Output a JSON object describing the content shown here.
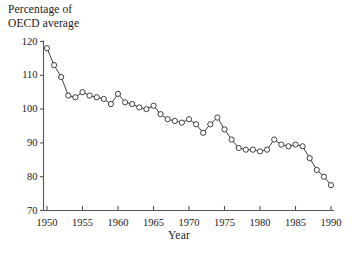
{
  "chart_data": {
    "type": "line",
    "title": "",
    "ylabel": "Percentage of\nOECD average",
    "xlabel": "Year",
    "grid": false,
    "legend": null,
    "marker": "open-circle",
    "xlim": [
      1949,
      1991
    ],
    "ylim": [
      70,
      121
    ],
    "xticks": [
      1950,
      1955,
      1960,
      1965,
      1970,
      1975,
      1980,
      1985,
      1990
    ],
    "xtick_labels": [
      "1950",
      "1955",
      "1960",
      "1965",
      "1970",
      "1975",
      "1980",
      "1985",
      "1990"
    ],
    "yticks": [
      70,
      80,
      90,
      100,
      110,
      120
    ],
    "ytick_labels": [
      "70",
      "80",
      "90",
      "100",
      "110",
      "120"
    ],
    "x": [
      1950,
      1951,
      1952,
      1953,
      1954,
      1955,
      1956,
      1957,
      1958,
      1959,
      1960,
      1961,
      1962,
      1963,
      1964,
      1965,
      1966,
      1967,
      1968,
      1969,
      1970,
      1971,
      1972,
      1973,
      1974,
      1975,
      1976,
      1977,
      1978,
      1979,
      1980,
      1981,
      1982,
      1983,
      1984,
      1985,
      1986,
      1987,
      1988,
      1989,
      1990
    ],
    "values": [
      118.0,
      113.0,
      109.5,
      104.0,
      103.5,
      105.0,
      104.0,
      103.5,
      103.0,
      101.5,
      104.5,
      102.0,
      101.5,
      100.5,
      100.0,
      101.0,
      98.5,
      97.0,
      96.5,
      96.0,
      97.0,
      95.5,
      93.0,
      95.5,
      97.5,
      94.0,
      91.0,
      88.5,
      88.0,
      88.0,
      87.5,
      88.0,
      91.0,
      89.5,
      89.0,
      89.5,
      89.0,
      85.5,
      82.0,
      80.0,
      77.5
    ]
  },
  "axis": {
    "ylabel_text": "Percentage of\nOECD average",
    "xlabel_text": "Year"
  },
  "colors": {
    "line": "#2a2a2a",
    "marker_stroke": "#2a2a2a",
    "marker_fill": "#ffffff",
    "axis": "#555555",
    "text": "#1a1a1a",
    "background": "#ffffff"
  }
}
